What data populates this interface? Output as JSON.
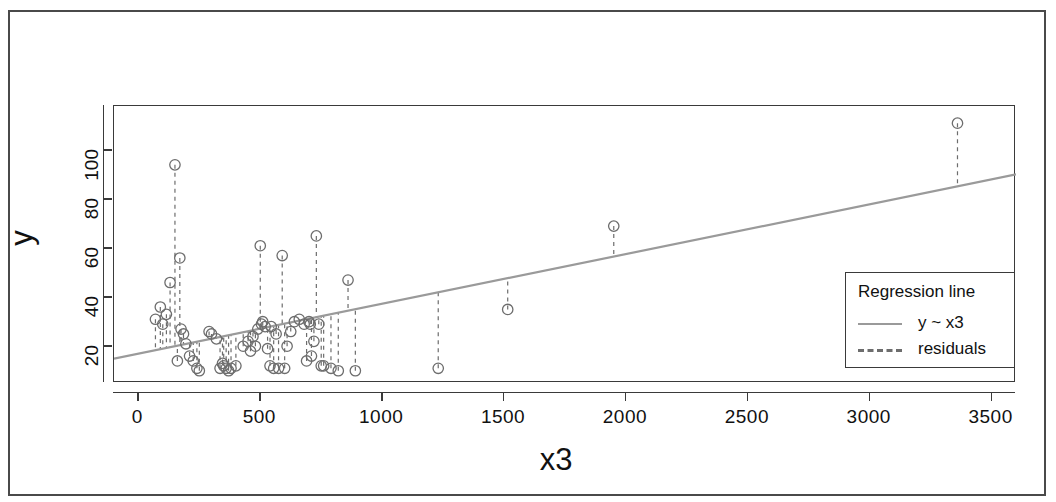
{
  "axes": {
    "xlabel": "x3",
    "ylabel": "y",
    "xticks": [
      0,
      500,
      1000,
      1500,
      2000,
      2500,
      3000,
      3500
    ],
    "yticks": [
      20,
      40,
      60,
      80,
      100
    ],
    "xlim": [
      -100,
      3600
    ],
    "ylim": [
      5,
      118
    ]
  },
  "legend": {
    "title": "Regression line",
    "fit_label": "y ~ x3",
    "residual_label": "residuals",
    "fit_color": "#9a9a9a",
    "residual_color": "#6d6d6d"
  },
  "chart_data": {
    "type": "scatter",
    "title": "",
    "xlabel": "x3",
    "ylabel": "y",
    "xlim": [
      -100,
      3600
    ],
    "ylim": [
      5,
      118
    ],
    "xticks": [
      0,
      500,
      1000,
      1500,
      2000,
      2500,
      3000,
      3500
    ],
    "yticks": [
      20,
      40,
      60,
      80,
      100
    ],
    "grid": false,
    "legend_position": "bottom-right",
    "point_color": "#6d6d6d",
    "point_marker": "open-circle",
    "fit": {
      "name": "y ~ x3",
      "color": "#9a9a9a",
      "style": "solid",
      "intercept": 17.0,
      "slope": 0.0203,
      "endpoints": [
        [
          -100,
          14.97
        ],
        [
          3600,
          90.08
        ]
      ]
    },
    "residuals": {
      "name": "residuals",
      "color": "#6d6d6d",
      "style": "dashed",
      "description": "vertical dashed segment from each point to the fitted line"
    },
    "x": [
      70,
      90,
      100,
      115,
      130,
      150,
      160,
      170,
      175,
      185,
      195,
      210,
      225,
      240,
      250,
      290,
      300,
      320,
      335,
      345,
      350,
      360,
      370,
      380,
      400,
      430,
      450,
      460,
      470,
      480,
      490,
      500,
      505,
      510,
      520,
      530,
      540,
      545,
      555,
      565,
      575,
      590,
      600,
      610,
      625,
      640,
      660,
      680,
      690,
      700,
      705,
      710,
      720,
      730,
      740,
      750,
      760,
      790,
      820,
      860,
      890,
      1230,
      1515,
      1950,
      3360
    ],
    "y": [
      31,
      36,
      29,
      33,
      46,
      94,
      14,
      56,
      27,
      25,
      21,
      16,
      14,
      11,
      10,
      26,
      25,
      23,
      11,
      13,
      12,
      11,
      10,
      11,
      12,
      20,
      22,
      18,
      24,
      20,
      27,
      61,
      29,
      30,
      28,
      19,
      12,
      28,
      11,
      25,
      11,
      57,
      11,
      20,
      26,
      30,
      31,
      29,
      14,
      30,
      29,
      16,
      22,
      65,
      29,
      12,
      12,
      11,
      10,
      47,
      10,
      11,
      35,
      69,
      111
    ]
  }
}
